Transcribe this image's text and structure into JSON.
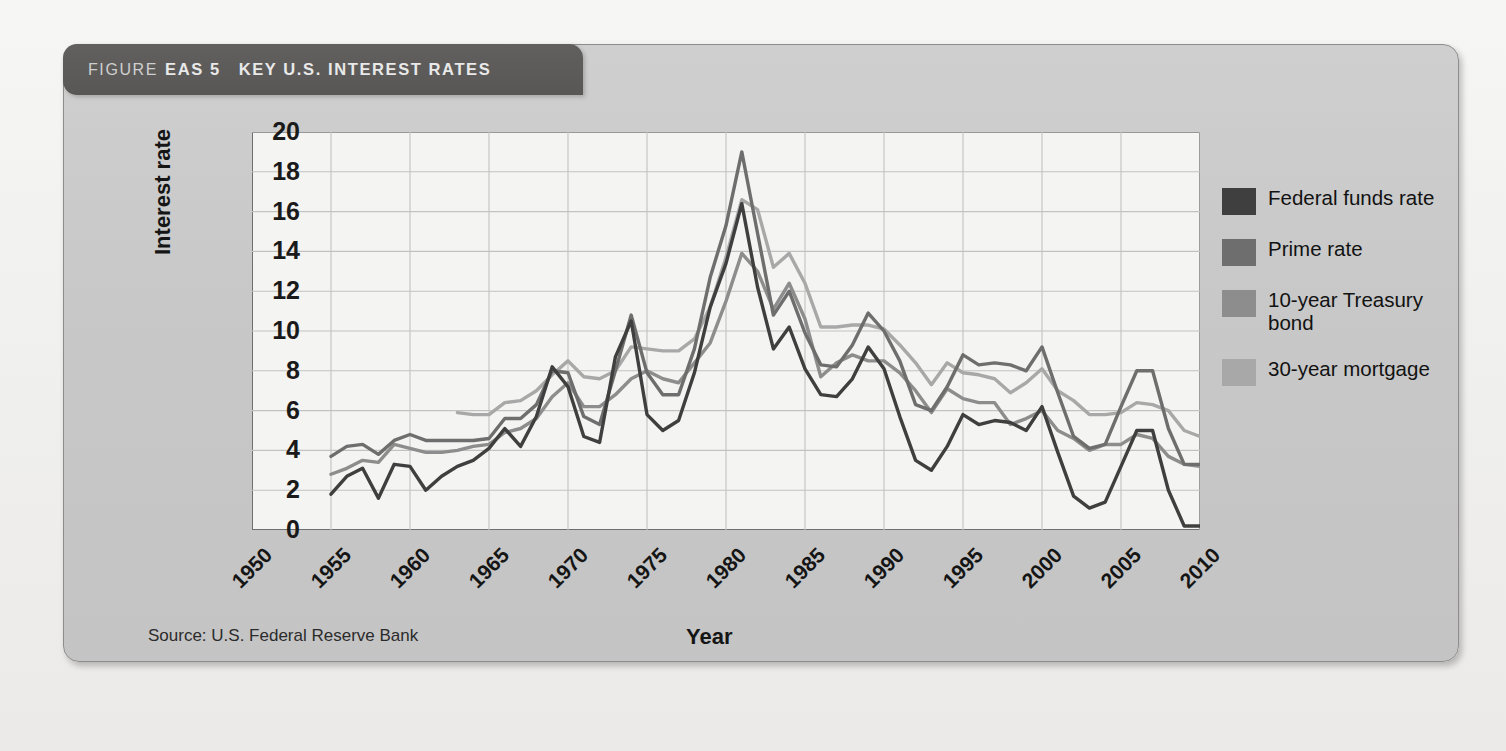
{
  "figure": {
    "label": "FIGURE",
    "number": "EAS 5",
    "title": "KEY U.S. INTEREST RATES",
    "source": "Source: U.S. Federal Reserve Bank"
  },
  "colors": {
    "panel_bg": "#c8c8c8",
    "title_bar": "#5c5b5a",
    "plot_bg": "#f4f4f2",
    "grid": "#c2c2c2",
    "axis": "#6f6f6f",
    "federal_funds_rate": "#3f3f3f",
    "prime_rate": "#6e6e6e",
    "treasury_10yr": "#8d8d8d",
    "mortgage_30yr": "#a8a8a8"
  },
  "chart_data": {
    "type": "line",
    "title": "KEY U.S. INTEREST RATES",
    "xlabel": "Year",
    "ylabel": "Interest rate",
    "xlim": [
      1950,
      2010
    ],
    "ylim": [
      0,
      20
    ],
    "xticks": [
      1950,
      1955,
      1960,
      1965,
      1970,
      1975,
      1980,
      1985,
      1990,
      1995,
      2000,
      2005,
      2010
    ],
    "yticks": [
      0,
      2,
      4,
      6,
      8,
      10,
      12,
      14,
      16,
      18,
      20
    ],
    "grid": true,
    "legend_position": "right",
    "series": [
      {
        "name": "Federal funds rate",
        "color": "#3f3f3f",
        "x": [
          1955,
          1956,
          1957,
          1958,
          1959,
          1960,
          1961,
          1962,
          1963,
          1964,
          1965,
          1966,
          1967,
          1968,
          1969,
          1970,
          1971,
          1972,
          1973,
          1974,
          1975,
          1976,
          1977,
          1978,
          1979,
          1980,
          1981,
          1982,
          1983,
          1984,
          1985,
          1986,
          1987,
          1988,
          1989,
          1990,
          1991,
          1992,
          1993,
          1994,
          1995,
          1996,
          1997,
          1998,
          1999,
          2000,
          2001,
          2002,
          2003,
          2004,
          2005,
          2006,
          2007,
          2008,
          2009,
          2010
        ],
        "values": [
          1.8,
          2.7,
          3.1,
          1.6,
          3.3,
          3.2,
          2.0,
          2.7,
          3.2,
          3.5,
          4.1,
          5.1,
          4.2,
          5.7,
          8.2,
          7.2,
          4.7,
          4.4,
          8.7,
          10.5,
          5.8,
          5.0,
          5.5,
          7.9,
          11.2,
          13.4,
          16.4,
          12.2,
          9.1,
          10.2,
          8.1,
          6.8,
          6.7,
          7.6,
          9.2,
          8.1,
          5.7,
          3.5,
          3.0,
          4.2,
          5.8,
          5.3,
          5.5,
          5.4,
          5.0,
          6.2,
          3.9,
          1.7,
          1.1,
          1.4,
          3.2,
          5.0,
          5.0,
          2.0,
          0.2,
          0.2
        ]
      },
      {
        "name": "Prime rate",
        "color": "#6e6e6e",
        "x": [
          1955,
          1956,
          1957,
          1958,
          1959,
          1960,
          1961,
          1962,
          1963,
          1964,
          1965,
          1966,
          1967,
          1968,
          1969,
          1970,
          1971,
          1972,
          1973,
          1974,
          1975,
          1976,
          1977,
          1978,
          1979,
          1980,
          1981,
          1982,
          1983,
          1984,
          1985,
          1986,
          1987,
          1988,
          1989,
          1990,
          1991,
          1992,
          1993,
          1994,
          1995,
          1996,
          1997,
          1998,
          1999,
          2000,
          2001,
          2002,
          2003,
          2004,
          2005,
          2006,
          2007,
          2008,
          2009,
          2010
        ],
        "values": [
          3.7,
          4.2,
          4.3,
          3.8,
          4.5,
          4.8,
          4.5,
          4.5,
          4.5,
          4.5,
          4.6,
          5.6,
          5.6,
          6.3,
          8.0,
          7.9,
          5.7,
          5.3,
          8.0,
          10.8,
          7.9,
          6.8,
          6.8,
          9.1,
          12.7,
          15.3,
          19.0,
          14.9,
          10.8,
          12.0,
          9.9,
          8.3,
          8.2,
          9.3,
          10.9,
          10.0,
          8.5,
          6.3,
          6.0,
          7.2,
          8.8,
          8.3,
          8.4,
          8.3,
          8.0,
          9.2,
          6.9,
          4.7,
          4.1,
          4.3,
          6.2,
          8.0,
          8.0,
          5.1,
          3.3,
          3.3
        ]
      },
      {
        "name": "10-year Treasury bond",
        "color": "#8d8d8d",
        "x": [
          1955,
          1956,
          1957,
          1958,
          1959,
          1960,
          1961,
          1962,
          1963,
          1964,
          1965,
          1966,
          1967,
          1968,
          1969,
          1970,
          1971,
          1972,
          1973,
          1974,
          1975,
          1976,
          1977,
          1978,
          1979,
          1980,
          1981,
          1982,
          1983,
          1984,
          1985,
          1986,
          1987,
          1988,
          1989,
          1990,
          1991,
          1992,
          1993,
          1994,
          1995,
          1996,
          1997,
          1998,
          1999,
          2000,
          2001,
          2002,
          2003,
          2004,
          2005,
          2006,
          2007,
          2008,
          2009,
          2010
        ],
        "values": [
          2.8,
          3.1,
          3.5,
          3.4,
          4.3,
          4.1,
          3.9,
          3.9,
          4.0,
          4.2,
          4.3,
          4.9,
          5.1,
          5.6,
          6.7,
          7.4,
          6.2,
          6.2,
          6.8,
          7.6,
          8.0,
          7.6,
          7.4,
          8.4,
          9.4,
          11.5,
          13.9,
          13.0,
          11.1,
          12.4,
          10.6,
          7.7,
          8.4,
          8.8,
          8.5,
          8.5,
          7.9,
          7.0,
          5.9,
          7.1,
          6.6,
          6.4,
          6.4,
          5.3,
          5.6,
          6.0,
          5.0,
          4.6,
          4.0,
          4.3,
          4.3,
          4.8,
          4.6,
          3.7,
          3.3,
          3.2
        ]
      },
      {
        "name": "30-year mortgage",
        "color": "#a8a8a8",
        "x": [
          1963,
          1964,
          1965,
          1966,
          1967,
          1968,
          1969,
          1970,
          1971,
          1972,
          1973,
          1974,
          1975,
          1976,
          1977,
          1978,
          1979,
          1980,
          1981,
          1982,
          1983,
          1984,
          1985,
          1986,
          1987,
          1988,
          1989,
          1990,
          1991,
          1992,
          1993,
          1994,
          1995,
          1996,
          1997,
          1998,
          1999,
          2000,
          2001,
          2002,
          2003,
          2004,
          2005,
          2006,
          2007,
          2008,
          2009,
          2010
        ],
        "values": [
          5.9,
          5.8,
          5.8,
          6.4,
          6.5,
          7.0,
          7.8,
          8.5,
          7.7,
          7.6,
          8.0,
          9.2,
          9.1,
          9.0,
          9.0,
          9.6,
          11.2,
          13.7,
          16.6,
          16.1,
          13.2,
          13.9,
          12.4,
          10.2,
          10.2,
          10.3,
          10.3,
          10.1,
          9.3,
          8.4,
          7.3,
          8.4,
          7.9,
          7.8,
          7.6,
          6.9,
          7.4,
          8.1,
          7.0,
          6.5,
          5.8,
          5.8,
          5.9,
          6.4,
          6.3,
          6.0,
          5.0,
          4.7
        ]
      }
    ]
  },
  "legend": {
    "items": [
      {
        "label": "Federal funds rate",
        "color": "#3f3f3f"
      },
      {
        "label": "Prime rate",
        "color": "#6e6e6e"
      },
      {
        "label": "10-year Treasury bond",
        "color": "#8d8d8d"
      },
      {
        "label": "30-year mortgage",
        "color": "#a8a8a8"
      }
    ]
  }
}
